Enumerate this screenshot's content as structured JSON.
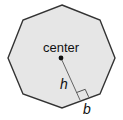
{
  "diagram": {
    "shape": "regular-octagon",
    "colors": {
      "background": "#ffffff",
      "fill": "#e6e6e6",
      "stroke": "#333333",
      "text": "#111111"
    },
    "labels": {
      "center": "center",
      "apothem": "h",
      "side": "b"
    },
    "vertices": [
      [
        62,
        5
      ],
      [
        100,
        20
      ],
      [
        115,
        58
      ],
      [
        100,
        94
      ],
      [
        62,
        108
      ],
      [
        23,
        94
      ],
      [
        8,
        58
      ],
      [
        23,
        20
      ]
    ],
    "center_point": [
      61,
      58
    ],
    "apothem_foot": [
      79,
      100
    ],
    "right_angle_marker": true
  }
}
